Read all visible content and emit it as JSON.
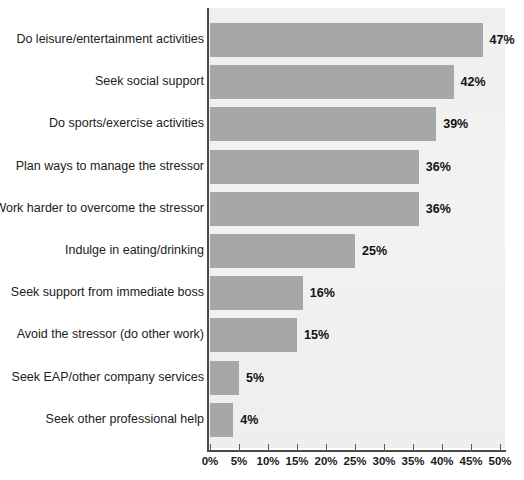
{
  "chart_data": {
    "type": "bar",
    "orientation": "horizontal",
    "title": "",
    "subtitle": "",
    "xlabel": "",
    "ylabel": "",
    "xlim": [
      0,
      50
    ],
    "grid": false,
    "legend": null,
    "categories": [
      "Do leisure/entertainment activities",
      "Seek social support",
      "Do sports/exercise activities",
      "Plan ways to manage the stressor",
      "Work harder to overcome the stressor",
      "Indulge in eating/drinking",
      "Seek support from immediate boss",
      "Avoid the stressor (do other work)",
      "Seek EAP/other company services",
      "Seek other professional help"
    ],
    "values": [
      47,
      42,
      39,
      36,
      36,
      25,
      16,
      15,
      5,
      4
    ],
    "value_labels": [
      "47%",
      "42%",
      "39%",
      "36%",
      "36%",
      "25%",
      "16%",
      "15%",
      "5%",
      "4%"
    ],
    "xticks": [
      0,
      5,
      10,
      15,
      20,
      25,
      30,
      35,
      40,
      45,
      50
    ],
    "xtick_labels": [
      "0%",
      "5%",
      "10%",
      "15%",
      "20%",
      "25%",
      "30%",
      "35%",
      "40%",
      "45%",
      "50%"
    ],
    "colors": {
      "bar": "#a7a7a7",
      "plot_background": "#f1f1f1",
      "page_background": "#ffffff",
      "axis": "#4a4a4a",
      "label_text": "#212121",
      "value_text": "#111111"
    }
  }
}
